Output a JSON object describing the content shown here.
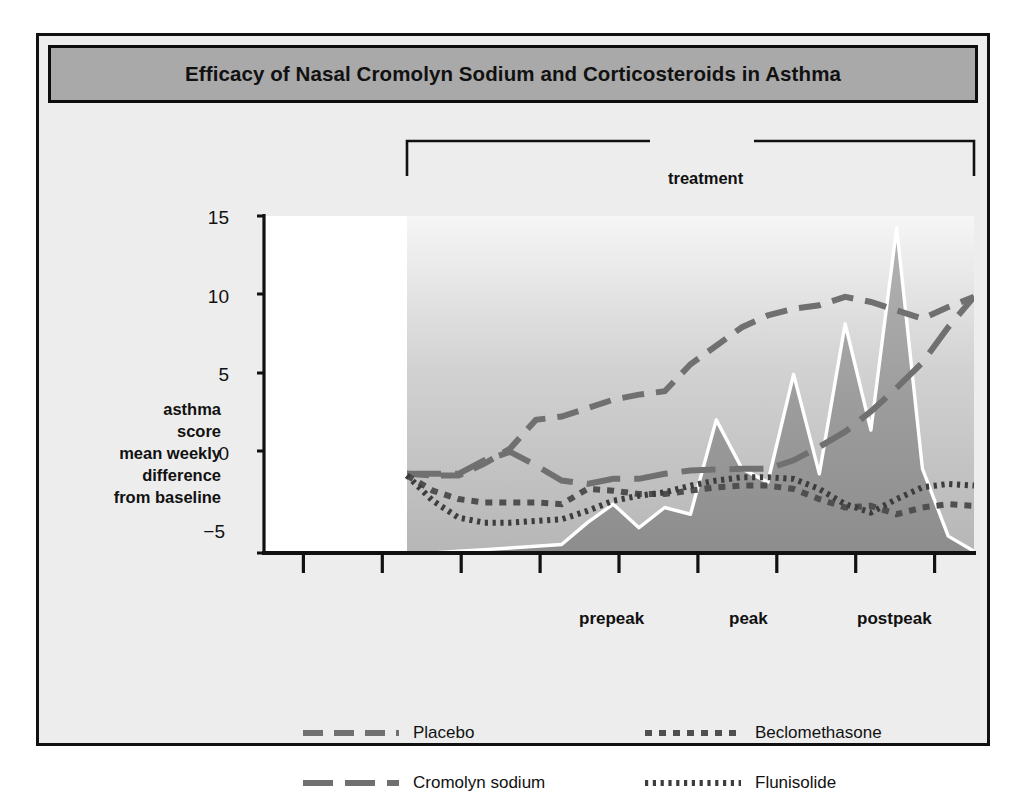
{
  "figure": {
    "title": "Efficacy of Nasal Cromolyn Sodium and Corticosteroids in Asthma",
    "title_bar_color": "#a9a9a9",
    "frame_color": "#111111",
    "background_color": "#ededed"
  },
  "bracket": {
    "label": "treatment"
  },
  "axis": {
    "y_title_lines": [
      "asthma",
      "score",
      "mean weekly",
      "difference",
      "from baseline"
    ],
    "y_ticks": [
      "15",
      "10",
      "5",
      "0",
      "−5"
    ]
  },
  "phases": [
    {
      "label": "prepeak"
    },
    {
      "label": "peak"
    },
    {
      "label": "postpeak"
    }
  ],
  "legend": [
    {
      "label": "Placebo",
      "style": "medium-dash",
      "color": "#707070"
    },
    {
      "label": "Cromolyn sodium",
      "style": "long-dash",
      "color": "#707070"
    },
    {
      "label": "Beclomethasone",
      "style": "square-dot",
      "color": "#555555"
    },
    {
      "label": "Flunisolide",
      "style": "fine-dot",
      "color": "#444444"
    }
  ],
  "chart_data": {
    "type": "line",
    "title": "Efficacy of Nasal Cromolyn Sodium and Corticosteroids in Asthma",
    "xlabel": "",
    "ylabel": "asthma score mean weekly difference from baseline",
    "ylim": [
      -5,
      15
    ],
    "yticks": [
      -5,
      0,
      5,
      10,
      15
    ],
    "grid": false,
    "legend_position": "bottom",
    "x_annotations": [
      "prepeak",
      "peak",
      "postpeak"
    ],
    "treatment_span_label": "treatment",
    "x": [
      0,
      1,
      2,
      3,
      4,
      5,
      6,
      7,
      8,
      9,
      10,
      11,
      12,
      13,
      14,
      15,
      16,
      17,
      18,
      19,
      20,
      21,
      22
    ],
    "series": [
      {
        "name": "Placebo",
        "style": "medium-dash",
        "values": [
          -0.3,
          -0.4,
          -0.4,
          0.3,
          1.2,
          2.9,
          3.1,
          3.6,
          4.1,
          4.4,
          4.6,
          6.2,
          7.3,
          8.4,
          9.1,
          9.5,
          9.7,
          10.2,
          9.9,
          9.4,
          8.9,
          9.6,
          10.2
        ]
      },
      {
        "name": "Cromolyn sodium",
        "style": "long-dash",
        "values": [
          -0.3,
          -0.3,
          -0.3,
          0.5,
          1.0,
          0.2,
          -0.7,
          -0.9,
          -0.6,
          -0.6,
          -0.3,
          -0.1,
          -0.05,
          0.0,
          0.0,
          0.5,
          1.3,
          2.2,
          3.4,
          4.8,
          6.3,
          8.4,
          10.2
        ]
      },
      {
        "name": "Beclomethasone",
        "style": "square-dot",
        "values": [
          -0.4,
          -1.3,
          -1.8,
          -2.0,
          -2.0,
          -2.0,
          -2.1,
          -1.2,
          -1.3,
          -1.5,
          -1.5,
          -1.3,
          -1.1,
          -1.0,
          -1.0,
          -1.2,
          -1.8,
          -2.3,
          -2.2,
          -2.7,
          -2.3,
          -2.1,
          -2.2
        ]
      },
      {
        "name": "Flunisolide",
        "style": "fine-dot",
        "values": [
          -0.4,
          -1.9,
          -2.9,
          -3.2,
          -3.2,
          -3.1,
          -3.0,
          -2.5,
          -1.9,
          -1.6,
          -1.4,
          -1.0,
          -0.7,
          -0.5,
          -0.5,
          -0.6,
          -1.2,
          -2.1,
          -2.6,
          -1.8,
          -1.1,
          -0.9,
          -1.0
        ]
      }
    ],
    "background_area": {
      "name": "pollen count",
      "style": "shaded-area-white-outline",
      "fill": "#9a9a9a",
      "outline": "#ffffff",
      "values": [
        -5.0,
        -5.0,
        -4.9,
        -4.8,
        -4.7,
        -4.6,
        -4.5,
        -3.2,
        -2.1,
        -3.5,
        -2.3,
        -2.7,
        2.9,
        0.0,
        -0.8,
        5.6,
        -0.3,
        8.6,
        2.3,
        14.3,
        0.0,
        -4.0,
        -4.9
      ]
    }
  }
}
